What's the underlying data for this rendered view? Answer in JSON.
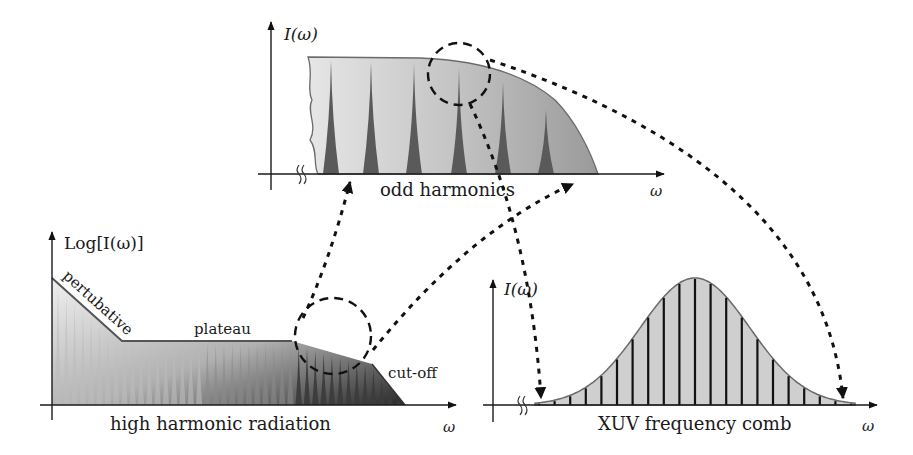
{
  "figure": {
    "top_panel": {
      "y_label": "I(ω)",
      "x_label": "ω",
      "caption": "odd harmonics"
    },
    "bottom_left_panel": {
      "y_label": "Log[I(ω)]",
      "x_label": "ω",
      "caption": "high harmonic radiation",
      "regions": [
        "pertubative",
        "plateau",
        "cut-off"
      ]
    },
    "bottom_right_panel": {
      "y_label": "I(ω)",
      "x_label": "ω",
      "caption": "XUV frequency comb"
    },
    "colors": {
      "ink": "#1a1a1a",
      "spike_dark": "#555555",
      "fill_light": "#d9d9d9",
      "fill_mid": "#a8a8a8",
      "gaussian_fill": "#cfcfcf"
    }
  }
}
